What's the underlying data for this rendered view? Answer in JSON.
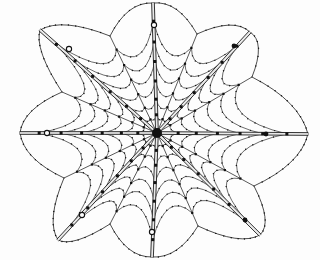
{
  "figure": {
    "title": "Orb spider web",
    "background_color": "#fdfdfd",
    "ink_color": "#111111",
    "width": 320,
    "height": 260
  },
  "chart_data": {
    "type": "scatter",
    "title": "Orb spider web",
    "xlabel": "",
    "ylabel": "",
    "xlim": [
      0,
      320
    ],
    "ylim": [
      0,
      260
    ],
    "grid": false,
    "legend": "none",
    "hub": {
      "x": 157,
      "y": 133,
      "radius": 5,
      "label": "hub"
    },
    "radii_count": 16,
    "anchor_count": 8,
    "spiral_ring_count": 7,
    "radii": [
      {
        "name": "radius-E",
        "angle_deg": 0,
        "end_x": 308,
        "end_y": 134,
        "type": "anchor",
        "doubled": true,
        "nodes": 9
      },
      {
        "name": "radius-ENE",
        "angle_deg": 22,
        "end_x": 252,
        "end_y": 77,
        "type": "frame",
        "doubled": false,
        "nodes": 6
      },
      {
        "name": "radius-NE",
        "angle_deg": 45,
        "end_x": 250,
        "end_y": 32,
        "type": "anchor",
        "doubled": true,
        "nodes": 8
      },
      {
        "name": "radius-NNE",
        "angle_deg": 68,
        "end_x": 197,
        "end_y": 34,
        "type": "frame",
        "doubled": false,
        "nodes": 6
      },
      {
        "name": "radius-N",
        "angle_deg": 90,
        "end_x": 153,
        "end_y": 3,
        "type": "anchor",
        "doubled": true,
        "nodes": 8
      },
      {
        "name": "radius-NNW",
        "angle_deg": 112,
        "end_x": 110,
        "end_y": 36,
        "type": "frame",
        "doubled": false,
        "nodes": 6
      },
      {
        "name": "radius-NW",
        "angle_deg": 135,
        "end_x": 40,
        "end_y": 30,
        "type": "anchor",
        "doubled": true,
        "nodes": 9
      },
      {
        "name": "radius-WNW",
        "angle_deg": 158,
        "end_x": 62,
        "end_y": 92,
        "type": "frame",
        "doubled": false,
        "nodes": 6
      },
      {
        "name": "radius-W",
        "angle_deg": 180,
        "end_x": 20,
        "end_y": 133,
        "type": "anchor",
        "doubled": true,
        "nodes": 8
      },
      {
        "name": "radius-WSW",
        "angle_deg": 202,
        "end_x": 64,
        "end_y": 178,
        "type": "frame",
        "doubled": false,
        "nodes": 6
      },
      {
        "name": "radius-SW",
        "angle_deg": 225,
        "end_x": 58,
        "end_y": 240,
        "type": "anchor",
        "doubled": true,
        "nodes": 9
      },
      {
        "name": "radius-SSW",
        "angle_deg": 248,
        "end_x": 110,
        "end_y": 224,
        "type": "frame",
        "doubled": false,
        "nodes": 6
      },
      {
        "name": "radius-S",
        "angle_deg": 270,
        "end_x": 152,
        "end_y": 257,
        "type": "anchor",
        "doubled": true,
        "nodes": 8
      },
      {
        "name": "radius-SSE",
        "angle_deg": 292,
        "end_x": 198,
        "end_y": 226,
        "type": "frame",
        "doubled": false,
        "nodes": 6
      },
      {
        "name": "radius-SE",
        "angle_deg": 315,
        "end_x": 260,
        "end_y": 235,
        "type": "anchor",
        "doubled": true,
        "nodes": 8
      },
      {
        "name": "radius-ESE",
        "angle_deg": 338,
        "end_x": 254,
        "end_y": 186,
        "type": "frame",
        "doubled": false,
        "nodes": 6
      }
    ],
    "anchor_junctions": [
      {
        "name": "junction-NW",
        "x": 69,
        "y": 49,
        "marker": "open-circle"
      },
      {
        "name": "junction-N",
        "x": 154,
        "y": 25,
        "marker": "open-circle"
      },
      {
        "name": "junction-NE",
        "x": 234,
        "y": 46,
        "marker": "filled-dot"
      },
      {
        "name": "junction-E",
        "x": 266,
        "y": 134,
        "marker": "filled-dot"
      },
      {
        "name": "junction-SE",
        "x": 245,
        "y": 220,
        "marker": "filled-dot"
      },
      {
        "name": "junction-S",
        "x": 152,
        "y": 232,
        "marker": "open-circle"
      },
      {
        "name": "junction-SW",
        "x": 82,
        "y": 215,
        "marker": "open-circle"
      },
      {
        "name": "junction-W",
        "x": 47,
        "y": 133,
        "marker": "open-circle"
      }
    ],
    "spiral_rings": [
      {
        "name": "ring-1",
        "index": 1,
        "radius_fraction": 0.14,
        "sag": 0.3,
        "dotted": true
      },
      {
        "name": "ring-2",
        "index": 2,
        "radius_fraction": 0.26,
        "sag": 0.3,
        "dotted": true
      },
      {
        "name": "ring-3",
        "index": 3,
        "radius_fraction": 0.4,
        "sag": 0.32,
        "dotted": true
      },
      {
        "name": "ring-4",
        "index": 4,
        "radius_fraction": 0.55,
        "sag": 0.33,
        "dotted": true
      },
      {
        "name": "ring-5",
        "index": 5,
        "radius_fraction": 0.7,
        "sag": 0.34,
        "dotted": true
      },
      {
        "name": "ring-6",
        "index": 6,
        "radius_fraction": 0.86,
        "sag": 0.34,
        "dotted": true
      },
      {
        "name": "ring-7",
        "index": 7,
        "radius_fraction": 1.0,
        "sag": 0.0,
        "dotted": true,
        "note": "frame ring bowing outward between anchors"
      }
    ],
    "series": [
      {
        "name": "radius node markers",
        "marker": "square",
        "color": "#111111",
        "note": "small black squares where capture spiral meets each radius"
      },
      {
        "name": "capture spiral droplets",
        "marker": "dot",
        "color": "#111111",
        "note": "fine dots distributed along every spiral arc"
      }
    ],
    "annotations": []
  }
}
